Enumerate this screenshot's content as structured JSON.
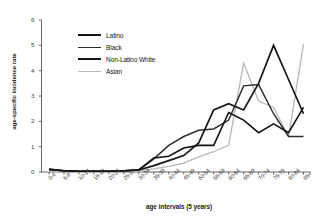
{
  "chart_data": {
    "type": "line",
    "title": "",
    "xlabel": "age intervals (5 years)",
    "ylabel": "age-specific incidence rate",
    "categories": [
      "0-4",
      "5-9",
      "10-14",
      "15-19",
      "20-24",
      "25-29",
      "30-34",
      "35-39",
      "40-44",
      "45-49",
      "50-54",
      "55-59",
      "60-64",
      "65-69",
      "70-74",
      "75-79",
      "80-84",
      "85+"
    ],
    "ylim": [
      0,
      6
    ],
    "yticks": [
      0,
      1,
      2,
      3,
      4,
      5,
      6
    ],
    "grid": false,
    "legend_position": "upper-left",
    "series": [
      {
        "name": "Latino",
        "color": "#111111",
        "width": 1.6,
        "values": [
          0.1,
          0.05,
          0.03,
          0.03,
          0.03,
          0.05,
          0.08,
          0.55,
          0.62,
          0.95,
          1.05,
          1.05,
          2.35,
          2.05,
          1.55,
          1.9,
          1.55,
          2.55
        ]
      },
      {
        "name": "Black",
        "color": "#2e2e2e",
        "width": 1.5,
        "values": [
          0.12,
          0.05,
          0.03,
          0.03,
          0.03,
          0.05,
          0.08,
          0.52,
          1.05,
          1.4,
          1.65,
          1.7,
          2.05,
          3.4,
          3.45,
          2.3,
          1.4,
          1.4
        ]
      },
      {
        "name": "Non-Latino White",
        "color": "#171717",
        "width": 1.7,
        "values": [
          0.1,
          0.05,
          0.03,
          0.03,
          0.03,
          0.05,
          0.08,
          0.25,
          0.45,
          0.65,
          1.15,
          2.45,
          2.7,
          2.45,
          3.5,
          5.0,
          3.65,
          2.3
        ]
      },
      {
        "name": "Asian",
        "color": "#b7b7b7",
        "width": 1.3,
        "values": [
          0.05,
          0.03,
          0.02,
          0.02,
          0.02,
          0.03,
          0.05,
          0.12,
          0.22,
          0.35,
          0.6,
          0.8,
          1.05,
          4.3,
          2.8,
          2.55,
          1.4,
          5.05
        ]
      }
    ]
  },
  "axis": {
    "y_tick_labels": [
      "0",
      "1",
      "2",
      "3",
      "4",
      "5",
      "6"
    ],
    "y_axis_title": "age-specific incidence rate",
    "x_axis_title": "age intervals (5 years)"
  },
  "legend": {
    "items": [
      {
        "label": "Latino"
      },
      {
        "label": "Black"
      },
      {
        "label": "Non-Latino White"
      },
      {
        "label": "Asian"
      }
    ]
  }
}
